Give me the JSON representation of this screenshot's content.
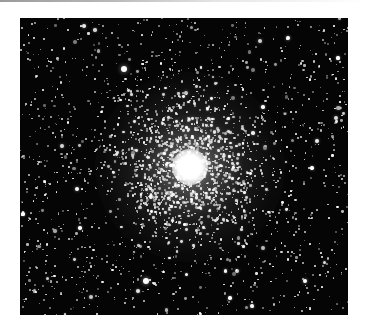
{
  "image": {
    "subject": "globular star cluster",
    "frame": {
      "left": 20,
      "top": 18,
      "width": 328,
      "height": 297
    },
    "background_color": "#050505",
    "border_color": "#ffffff",
    "top_edge_gradient": [
      "#9a9a9a",
      "#ffffff"
    ]
  },
  "cluster": {
    "center_x": 170,
    "center_y": 149,
    "core_radius": 18,
    "halo_radius": 95,
    "core_color": "#ffffff"
  },
  "bright_stars": [
    {
      "x": 104,
      "y": 51,
      "r": 3.2
    },
    {
      "x": 126,
      "y": 263,
      "r": 3.0
    },
    {
      "x": 3,
      "y": 196,
      "r": 1.6
    },
    {
      "x": 268,
      "y": 20,
      "r": 2.0
    },
    {
      "x": 285,
      "y": 263,
      "r": 2.2
    },
    {
      "x": 243,
      "y": 89,
      "r": 1.8
    },
    {
      "x": 292,
      "y": 150,
      "r": 1.7
    },
    {
      "x": 60,
      "y": 210,
      "r": 1.8
    },
    {
      "x": 318,
      "y": 40,
      "r": 1.6
    },
    {
      "x": 210,
      "y": 280,
      "r": 1.7
    }
  ],
  "field_stars": {
    "count": 1400,
    "seed": 7
  },
  "cluster_stars": {
    "count": 1100,
    "seed": 13,
    "sigma": 38
  }
}
